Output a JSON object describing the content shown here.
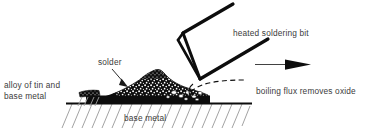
{
  "diagram": {
    "type": "technical-illustration",
    "background_color": "#ffffff",
    "ink_color": "#111111",
    "hatch_color": "#9a9a9a",
    "text_color": "#3b3b3b",
    "labels": {
      "alloy": "alloy of tin and\nbase metal",
      "solder": "solder",
      "heated_bit": "heated soldering bit",
      "flux": "boiling flux removes oxide",
      "base_metal": "base metal"
    },
    "elements": {
      "solder_mound": "stippled solder fillet",
      "soldering_bit": "wedge shaped heated bit",
      "flux_front": "dashed boiling flux front",
      "motion_arrow": "arrow indicating bit travel direction",
      "substrate": "hatched base metal surface",
      "leader_solder": "leader line from solder label to mound",
      "leader_alloy": "alloy label pointing to left edge of fillet"
    }
  }
}
